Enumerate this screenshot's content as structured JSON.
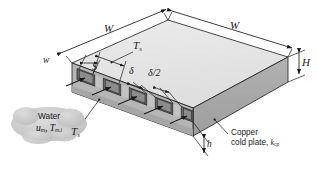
{
  "figure": {
    "colors": {
      "top_face": "#e6e6e6",
      "front_face": "#a9a9a9",
      "side_face": "#8f8f8f",
      "channel_interior": "#6f6f6f",
      "fin_face": "#c2c2c2",
      "outline": "#1a1a1a",
      "cloud_fill": "#c9c9c9",
      "background": "#ffffff"
    }
  },
  "dimensions": {
    "width_top_left": "W",
    "width_top_right": "W",
    "channel_width": "w",
    "pitch": "S",
    "fin_thickness": "δ",
    "half_fin_thickness": "δ/2",
    "plate_height": "H",
    "channel_height": "h"
  },
  "temperatures": {
    "surface_top": {
      "symbol": "T",
      "subscript": "s"
    },
    "surface_front": {
      "symbol": "T",
      "subscript": "s"
    }
  },
  "annotations": {
    "fluid": {
      "name": "Water",
      "mean_velocity": {
        "symbol": "u",
        "subscript": "m"
      },
      "inlet_temperature": {
        "symbol": "T",
        "subscript": "m,i"
      },
      "properties_line": "uₘ, Tₘ,ᵢ"
    },
    "material": {
      "line1": "Copper",
      "line2_prefix": "cold plate, ",
      "conductivity_symbol": "k",
      "conductivity_subscript": "cp"
    }
  }
}
